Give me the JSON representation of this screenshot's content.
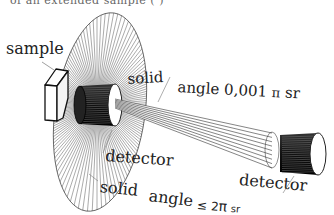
{
  "labels": {
    "sample": "sample",
    "solid_top_word": "solid",
    "angle_small": "angle 0,001",
    "pi_small": "π",
    "sr_small": "sr",
    "detector_near": "detector",
    "detector_far": "detector",
    "solid_bottom_word": "solid",
    "angle_large_word": "angle",
    "leq": "≤",
    "two": "2",
    "pi_large": "π",
    "sr_large": "sr"
  },
  "cut_text": "of an extended sample (                     )",
  "colors": {
    "ink": "#1a1a1a",
    "hatch": "#555555",
    "background": "#ffffff"
  }
}
